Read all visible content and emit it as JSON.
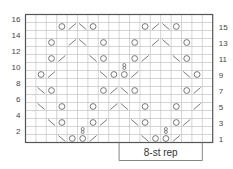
{
  "chart": {
    "columns": 18,
    "rows": 16,
    "left_row_labels": [
      "2",
      "4",
      "6",
      "8",
      "10",
      "12",
      "14",
      "16"
    ],
    "right_row_labels": [
      "1",
      "3",
      "5",
      "7",
      "9",
      "11",
      "13",
      "15"
    ],
    "repeat_label": "8-st rep",
    "repeat_start_col": 9,
    "repeat_width": 8,
    "legend_symbols": {
      "O": "yarn-over",
      "/": "k2tog",
      "\\": "ssk",
      "8": "twisted-stitch"
    }
  },
  "chart_data": {
    "type": "table",
    "note": "rows numbered bottom-up; cols 0-17 left to right",
    "cells": [
      {
        "row": 1,
        "col": 3,
        "s": "\\"
      },
      {
        "row": 1,
        "col": 4,
        "s": "O"
      },
      {
        "row": 1,
        "col": 5,
        "s": "O"
      },
      {
        "row": 1,
        "col": 6,
        "s": "/"
      },
      {
        "row": 1,
        "col": 11,
        "s": "\\"
      },
      {
        "row": 1,
        "col": 12,
        "s": "O"
      },
      {
        "row": 1,
        "col": 13,
        "s": "O"
      },
      {
        "row": 1,
        "col": 14,
        "s": "/"
      },
      {
        "row": 2,
        "col": 5,
        "s": "8"
      },
      {
        "row": 2,
        "col": 13,
        "s": "8"
      },
      {
        "row": 3,
        "col": 2,
        "s": "\\"
      },
      {
        "row": 3,
        "col": 3,
        "s": "O"
      },
      {
        "row": 3,
        "col": 6,
        "s": "O"
      },
      {
        "row": 3,
        "col": 7,
        "s": "/"
      },
      {
        "row": 3,
        "col": 10,
        "s": "\\"
      },
      {
        "row": 3,
        "col": 11,
        "s": "O"
      },
      {
        "row": 3,
        "col": 14,
        "s": "O"
      },
      {
        "row": 3,
        "col": 15,
        "s": "/"
      },
      {
        "row": 5,
        "col": 1,
        "s": "\\"
      },
      {
        "row": 5,
        "col": 3,
        "s": "O"
      },
      {
        "row": 5,
        "col": 6,
        "s": "O"
      },
      {
        "row": 5,
        "col": 8,
        "s": "/"
      },
      {
        "row": 5,
        "col": 9,
        "s": "\\"
      },
      {
        "row": 5,
        "col": 11,
        "s": "O"
      },
      {
        "row": 5,
        "col": 14,
        "s": "O"
      },
      {
        "row": 5,
        "col": 16,
        "s": "/"
      },
      {
        "row": 7,
        "col": 1,
        "s": "\\"
      },
      {
        "row": 7,
        "col": 2,
        "s": "O"
      },
      {
        "row": 7,
        "col": 7,
        "s": "O"
      },
      {
        "row": 7,
        "col": 8,
        "s": "/"
      },
      {
        "row": 7,
        "col": 9,
        "s": "\\"
      },
      {
        "row": 7,
        "col": 10,
        "s": "O"
      },
      {
        "row": 7,
        "col": 15,
        "s": "O"
      },
      {
        "row": 7,
        "col": 16,
        "s": "/"
      },
      {
        "row": 9,
        "col": 1,
        "s": "O"
      },
      {
        "row": 9,
        "col": 2,
        "s": "/"
      },
      {
        "row": 9,
        "col": 7,
        "s": "\\"
      },
      {
        "row": 9,
        "col": 8,
        "s": "O"
      },
      {
        "row": 9,
        "col": 9,
        "s": "O"
      },
      {
        "row": 9,
        "col": 10,
        "s": "/"
      },
      {
        "row": 9,
        "col": 15,
        "s": "\\"
      },
      {
        "row": 9,
        "col": 16,
        "s": "O"
      },
      {
        "row": 10,
        "col": 9,
        "s": "8"
      },
      {
        "row": 11,
        "col": 2,
        "s": "O"
      },
      {
        "row": 11,
        "col": 3,
        "s": "/"
      },
      {
        "row": 11,
        "col": 6,
        "s": "\\"
      },
      {
        "row": 11,
        "col": 7,
        "s": "O"
      },
      {
        "row": 11,
        "col": 10,
        "s": "O"
      },
      {
        "row": 11,
        "col": 11,
        "s": "/"
      },
      {
        "row": 11,
        "col": 14,
        "s": "\\"
      },
      {
        "row": 11,
        "col": 15,
        "s": "O"
      },
      {
        "row": 13,
        "col": 2,
        "s": "O"
      },
      {
        "row": 13,
        "col": 4,
        "s": "/"
      },
      {
        "row": 13,
        "col": 5,
        "s": "\\"
      },
      {
        "row": 13,
        "col": 7,
        "s": "O"
      },
      {
        "row": 13,
        "col": 10,
        "s": "O"
      },
      {
        "row": 13,
        "col": 12,
        "s": "/"
      },
      {
        "row": 13,
        "col": 13,
        "s": "\\"
      },
      {
        "row": 13,
        "col": 15,
        "s": "O"
      },
      {
        "row": 15,
        "col": 3,
        "s": "O"
      },
      {
        "row": 15,
        "col": 4,
        "s": "/"
      },
      {
        "row": 15,
        "col": 5,
        "s": "\\"
      },
      {
        "row": 15,
        "col": 6,
        "s": "O"
      },
      {
        "row": 15,
        "col": 11,
        "s": "O"
      },
      {
        "row": 15,
        "col": 12,
        "s": "/"
      },
      {
        "row": 15,
        "col": 13,
        "s": "\\"
      },
      {
        "row": 15,
        "col": 14,
        "s": "O"
      }
    ]
  }
}
